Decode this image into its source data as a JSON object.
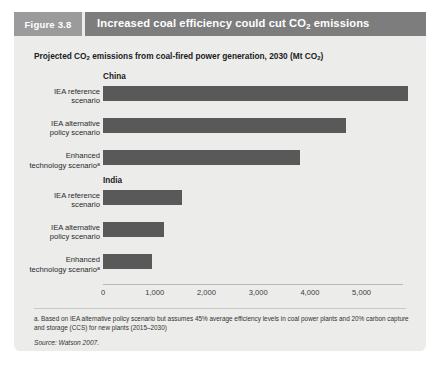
{
  "figure": {
    "tab_label": "Figure 3.8",
    "title_plain": "Increased coal efficiency could cut CO2 emissions",
    "title_pre": "Increased coal efficiency could cut CO",
    "title_sub": "2",
    "title_post": " emissions",
    "subtitle_pre": "Projected CO",
    "subtitle_sub1": "2",
    "subtitle_mid": " emissions from coal-fired power generation, 2030 (Mt CO",
    "subtitle_sub2": "2",
    "subtitle_post": ")",
    "footnote": "a. Based on IEA alternative policy scenario but assumes 45% average efficiency levels in coal power plants and 20% carbon capture and storage (CCS)  for new plants (2015–2030)",
    "source": "Source: Watson 2007."
  },
  "colors": {
    "bar": "#595959",
    "panel_bg": "#ececeb",
    "title_bar": "#7d7d7d",
    "tab_bg": "#9b9b9b",
    "text": "#1b1b1b"
  },
  "chart_data": {
    "type": "bar",
    "orientation": "horizontal",
    "title": "Increased coal efficiency could cut CO2 emissions",
    "subtitle": "Projected CO2 emissions from coal-fired power generation, 2030 (Mt CO2)",
    "xlabel": "",
    "ylabel": "",
    "xlim": [
      0,
      5800
    ],
    "grid": false,
    "legend": "none",
    "xticks": [
      0,
      1000,
      2000,
      3000,
      4000,
      5000
    ],
    "xtick_labels": [
      "0",
      "1,000",
      "2,000",
      "3,000",
      "4,000",
      "5,000"
    ],
    "groups": [
      {
        "name": "China",
        "categories": [
          "IEA reference scenario",
          "IEA alternative policy scenario",
          "Enhanced technology scenario"
        ],
        "category_lines": [
          [
            "IEA reference",
            "scenario"
          ],
          [
            "IEA alternative",
            "policy scenario"
          ],
          [
            "Enhanced",
            "technology scenario"
          ]
        ],
        "footnote_marker": [
          false,
          false,
          true
        ],
        "values": [
          5900,
          4700,
          3800
        ]
      },
      {
        "name": "India",
        "categories": [
          "IEA reference scenario",
          "IEA alternative policy scenario",
          "Enhanced technology scenario"
        ],
        "category_lines": [
          [
            "IEA reference",
            "scenario"
          ],
          [
            "IEA alternative",
            "policy scenario"
          ],
          [
            "Enhanced",
            "technology scenario"
          ]
        ],
        "footnote_marker": [
          false,
          false,
          true
        ],
        "values": [
          1520,
          1170,
          940
        ]
      }
    ],
    "units": "Mt CO2",
    "year": 2030
  }
}
